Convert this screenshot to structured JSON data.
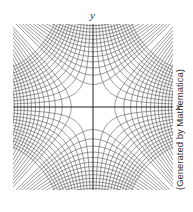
{
  "figure": {
    "x_axis_label": "x",
    "y_axis_label": "y",
    "credit": "(Generated by Mathematica)"
  },
  "diagram": {
    "type": "orthogonal hyperbola families (level curves)",
    "families": [
      {
        "name": "x^2 - y^2 = c",
        "c_values": [
          -6.5,
          -6,
          -5.5,
          -5,
          -4.5,
          -4,
          -3.5,
          -3,
          -2.5,
          -2,
          -1.5,
          -1,
          -0.5,
          0.5,
          1,
          1.5,
          2,
          2.5,
          3,
          3.5,
          4,
          4.5,
          5,
          5.5,
          6,
          6.5
        ]
      },
      {
        "name": "xy = c",
        "c_values": [
          -3.25,
          -3,
          -2.75,
          -2.5,
          -2.25,
          -2,
          -1.75,
          -1.5,
          -1.25,
          -1,
          -0.75,
          -0.5,
          -0.25,
          0.25,
          0.5,
          0.75,
          1,
          1.25,
          1.5,
          1.75,
          2,
          2.25,
          2.5,
          2.75,
          3,
          3.25
        ]
      }
    ],
    "domain": {
      "x": [
        -2.6,
        2.6
      ],
      "y": [
        -2.6,
        2.6
      ]
    },
    "line_color": "#555555",
    "axis_color": "#222222"
  }
}
